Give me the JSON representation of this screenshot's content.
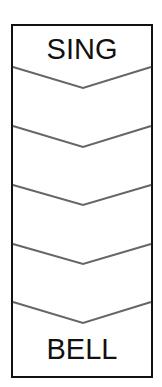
{
  "diagram": {
    "top_label": "SING",
    "bottom_label": "BELL",
    "frame": {
      "x": 11,
      "y": 24,
      "width": 142,
      "height": 354,
      "stroke_color": "#111111",
      "stroke_width": 2
    },
    "chevron_color": "#666666",
    "chevron_count": 5,
    "chevrons": [
      {
        "edge_y": 67,
        "vertex_y": 88
      },
      {
        "edge_y": 126,
        "vertex_y": 147
      },
      {
        "edge_y": 185,
        "vertex_y": 205
      },
      {
        "edge_y": 244,
        "vertex_y": 264
      },
      {
        "edge_y": 302,
        "vertex_y": 323
      }
    ]
  }
}
